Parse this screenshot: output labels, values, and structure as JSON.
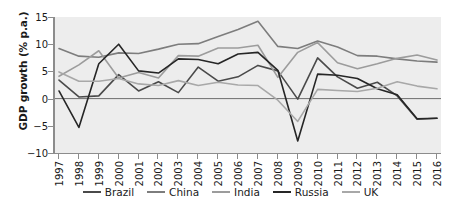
{
  "chart_data": {
    "type": "line",
    "title": "",
    "xlabel": "",
    "ylabel": "GDP growth (% p.a.)",
    "ylim": [
      -10,
      15
    ],
    "yticks": [
      15,
      10,
      5,
      0,
      -5,
      -10
    ],
    "ytick_labels": [
      "15",
      "10",
      "5",
      "0",
      "−5",
      "−10"
    ],
    "grid": false,
    "legend_position": "bottom",
    "plot_background": "#ededed",
    "axis_color": "#8c8c8c",
    "categories": [
      1997,
      1998,
      1999,
      2000,
      2001,
      2002,
      2003,
      2004,
      2005,
      2006,
      2007,
      2008,
      2009,
      2010,
      2011,
      2012,
      2013,
      2014,
      2015,
      2016
    ],
    "xtick_labels": [
      "1997",
      "1998",
      "1999",
      "2000",
      "2001",
      "2002",
      "2003",
      "2004",
      "2005",
      "2006",
      "2007",
      "2008",
      "2009",
      "2010",
      "2011",
      "2012",
      "2013",
      "2014",
      "2015",
      "2016"
    ],
    "series": [
      {
        "name": "Brazil",
        "color": "#4a4a4a",
        "values": [
          3.4,
          0.3,
          0.5,
          4.4,
          1.4,
          3.1,
          1.1,
          5.8,
          3.2,
          4.0,
          6.1,
          5.1,
          -0.1,
          7.5,
          4.0,
          1.9,
          3.0,
          0.5,
          -3.8,
          -3.6
        ]
      },
      {
        "name": "China",
        "color": "#7d7d7d",
        "values": [
          9.2,
          7.8,
          7.6,
          8.4,
          8.3,
          9.1,
          10.0,
          10.1,
          11.4,
          12.7,
          14.2,
          9.6,
          9.2,
          10.6,
          9.5,
          7.9,
          7.8,
          7.3,
          6.9,
          6.7
        ]
      },
      {
        "name": "India",
        "color": "#9c9c9c",
        "values": [
          4.1,
          6.2,
          8.8,
          3.8,
          4.8,
          3.8,
          7.9,
          7.8,
          9.3,
          9.3,
          9.8,
          3.9,
          8.5,
          10.3,
          6.6,
          5.5,
          6.4,
          7.4,
          8.0,
          7.1
        ]
      },
      {
        "name": "Russia",
        "color": "#262626",
        "values": [
          1.4,
          -5.3,
          6.4,
          10.0,
          5.1,
          4.7,
          7.3,
          7.2,
          6.4,
          8.2,
          8.5,
          5.2,
          -7.8,
          4.5,
          4.3,
          3.7,
          1.8,
          0.7,
          -3.7,
          -3.6
        ]
      },
      {
        "name": "UK",
        "color": "#a8a8a8",
        "values": [
          4.9,
          3.2,
          3.2,
          3.7,
          2.7,
          2.4,
          3.3,
          2.4,
          3.0,
          2.5,
          2.4,
          -0.3,
          -4.2,
          1.7,
          1.5,
          1.3,
          1.9,
          3.1,
          2.3,
          1.8
        ]
      }
    ]
  },
  "legend": {
    "items": [
      {
        "label": "Brazil"
      },
      {
        "label": "China"
      },
      {
        "label": "India"
      },
      {
        "label": "Russia"
      },
      {
        "label": "UK"
      }
    ]
  }
}
